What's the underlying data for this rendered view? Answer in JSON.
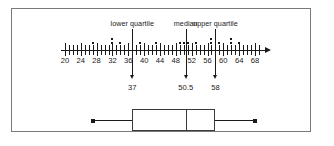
{
  "figure": {
    "kind": "dot-plot-with-boxplot",
    "border_color": "#7a7a7a",
    "ink_color": "#1a1a1a"
  },
  "callouts": [
    {
      "name": "lower-quartile",
      "label": "lower quartile",
      "value": 37,
      "value_label": "37"
    },
    {
      "name": "median",
      "label": "median",
      "value": 50.5,
      "value_label": "50.5"
    },
    {
      "name": "upper-quartile",
      "label": "upper quartile",
      "value": 58,
      "value_label": "58"
    }
  ],
  "axis": {
    "min": 19,
    "max": 70,
    "tick_step": 1,
    "label_step": 4,
    "tick_labels": [
      "20",
      "24",
      "28",
      "32",
      "36",
      "40",
      "44",
      "48",
      "52",
      "56",
      "60",
      "64",
      "68"
    ],
    "tick_values": [
      20,
      24,
      28,
      32,
      36,
      40,
      44,
      48,
      52,
      56,
      60,
      64,
      68
    ],
    "arrow": "right"
  },
  "chart_data": {
    "type": "scatter",
    "title": "",
    "xlabel": "",
    "ylabel": "",
    "grid": false,
    "legend": null,
    "xlim": [
      19,
      70
    ],
    "xticks": [
      20,
      21,
      22,
      23,
      24,
      25,
      26,
      27,
      28,
      29,
      30,
      31,
      32,
      33,
      34,
      35,
      36,
      37,
      38,
      39,
      40,
      41,
      42,
      43,
      44,
      45,
      46,
      47,
      48,
      49,
      50,
      51,
      52,
      53,
      54,
      55,
      56,
      57,
      58,
      59,
      60,
      61,
      62,
      63,
      64,
      65,
      66,
      67,
      68,
      69
    ],
    "xticklabels": [
      "20",
      "",
      "",
      "",
      "24",
      "",
      "",
      "",
      "28",
      "",
      "",
      "",
      "32",
      "",
      "",
      "",
      "36",
      "",
      "",
      "",
      "40",
      "",
      "",
      "",
      "44",
      "",
      "",
      "",
      "48",
      "",
      "",
      "",
      "52",
      "",
      "",
      "",
      "56",
      "",
      "",
      "",
      "60",
      "",
      "",
      "",
      "64",
      "",
      "",
      "",
      "68",
      ""
    ],
    "annotations": [
      {
        "text": "lower quartile",
        "x": 37
      },
      {
        "text": "median",
        "x": 50.5
      },
      {
        "text": "upper quartile",
        "x": 58
      },
      {
        "text": "37",
        "x": 37
      },
      {
        "text": "50.5",
        "x": 50.5
      },
      {
        "text": "58",
        "x": 58
      }
    ],
    "dot_plot": {
      "description": "stacked dots above the number line; each dot is one observation",
      "stacks": [
        {
          "x": 27,
          "count": 1
        },
        {
          "x": 32,
          "count": 2
        },
        {
          "x": 34,
          "count": 1
        },
        {
          "x": 39,
          "count": 1
        },
        {
          "x": 43,
          "count": 1
        },
        {
          "x": 49,
          "count": 1
        },
        {
          "x": 50,
          "count": 1
        },
        {
          "x": 51,
          "count": 1
        },
        {
          "x": 53,
          "count": 1
        },
        {
          "x": 57,
          "count": 2
        },
        {
          "x": 59,
          "count": 1
        },
        {
          "x": 62,
          "count": 2
        },
        {
          "x": 64,
          "count": 1
        }
      ]
    },
    "box_plot": {
      "min": 27,
      "q1": 37,
      "median": 50.5,
      "q3": 58,
      "max": 68
    }
  }
}
